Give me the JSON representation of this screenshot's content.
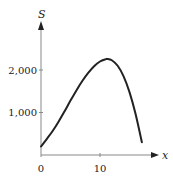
{
  "chart_data": {
    "type": "line",
    "title": "",
    "xlabel": "x",
    "ylabel": "S",
    "xlim": [
      0,
      18.5
    ],
    "ylim": [
      0,
      3100
    ],
    "grid": false,
    "legend": null,
    "x_ticks": [
      0,
      10
    ],
    "x_tick_labels": [
      "0",
      "10"
    ],
    "y_ticks": [
      1000,
      2000
    ],
    "y_tick_labels": [
      "1,000",
      "2,000"
    ],
    "series": [
      {
        "name": "S(x)",
        "x": [
          0,
          1,
          2,
          3,
          4,
          5,
          6,
          7,
          8,
          9,
          10,
          11,
          11.2,
          12,
          13,
          14,
          15,
          16,
          17.1
        ],
        "y": [
          200,
          380,
          570,
          790,
          1030,
          1280,
          1520,
          1740,
          1930,
          2090,
          2200,
          2255,
          2260,
          2230,
          2100,
          1850,
          1480,
          980,
          300
        ]
      }
    ],
    "color": "#222222"
  }
}
